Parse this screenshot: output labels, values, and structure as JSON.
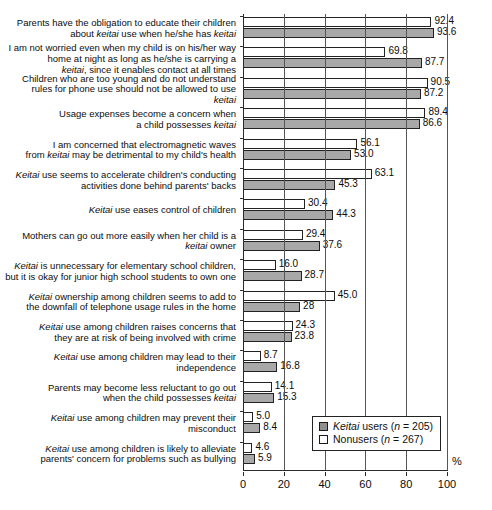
{
  "chart_data": {
    "type": "bar",
    "orientation": "horizontal",
    "title": "",
    "xlabel": "%",
    "ylabel": "",
    "xlim": [
      0,
      100
    ],
    "xticks": [
      "0",
      "20",
      "40",
      "60",
      "80",
      "100"
    ],
    "grid": true,
    "legend_position": "bottom-right",
    "categories": [
      "Parents have the obligation to educate their children about keitai use when he/she has keitai",
      "I am not worried even when my child is on his/her way home at night as long as he/she is carrying a keitai, since it enables contact at all times",
      "Children who are too young and do not understand rules for phone use should not be allowed to use keitai",
      "Usage expenses become a concern when a child possesses keitai",
      "I am concerned that electromagnetic waves from keitai may be detrimental to my child's health",
      "Keitai use seems to accelerate children's conducting activities done behind  parents' backs",
      "Keitai use eases control of children",
      "Mothers can go out more easily when her child is a keitai owner",
      "Keitai is unnecessary for elementary school children, but it is okay for junior high school students to own one",
      "Keitai ownership among children seems to add to the downfall of telephone usage rules in the home",
      "Keitai use among children raises concerns that they are at risk of being involved with crime",
      "Keitai use among children may lead to their independence",
      "Parents may become less reluctant to go out when the child possesses keitai",
      "Keitai use among children may prevent their misconduct",
      "Keitai use among children is likely to alleviate parents' concern for problems such as bullying"
    ],
    "series": [
      {
        "name": "Nonusers (n = 267)",
        "key": "nonusers",
        "color": "#ffffff",
        "values": [
          92.4,
          69.8,
          90.5,
          89.4,
          56.1,
          63.1,
          30.4,
          29.4,
          16.0,
          45.0,
          24.3,
          8.7,
          14.1,
          5.0,
          4.6
        ],
        "labels": [
          "92.4",
          "69.8",
          "90.5",
          "89.4",
          "56.1",
          "63.1",
          "30.4",
          "29.4",
          "16.0",
          "45.0",
          "24.3",
          "8.7",
          "14.1",
          "5.0",
          "4.6"
        ]
      },
      {
        "name": "Keitai users (n = 205)",
        "key": "users",
        "color": "#a8a8a8",
        "values": [
          93.6,
          87.7,
          87.2,
          86.6,
          53.0,
          45.3,
          44.3,
          37.6,
          28.7,
          28.0,
          23.8,
          16.8,
          15.3,
          8.4,
          5.9
        ],
        "labels": [
          "93.6",
          "87.7",
          "87.2",
          "86.6",
          "53.0",
          "45.3",
          "44.3",
          "37.6",
          "28.7",
          "28",
          "23.8",
          "16.8",
          "15.3",
          "8.4",
          "5.9"
        ]
      }
    ]
  },
  "legend": {
    "items": [
      {
        "label_html": "<em>Keitai</em> users (<em>n</em> = 205)",
        "swatch": "users"
      },
      {
        "label_html": "Nonusers (<em>n</em> = 267)",
        "swatch": "nonusers"
      }
    ]
  },
  "category_labels_html": [
    "Parents have the obligation to educate their children<br>about <em>keitai</em> use when he/she has <em>keitai</em>",
    "I am not worried even when my child is on his/her way<br>home at night as long as he/she is carrying a<br><em>keitai</em>, since it enables contact at all times",
    "Children who are too young and do not understand<br>rules for phone use should not be allowed to use<br><em>keitai</em>",
    "Usage expenses become a concern when<br>a child possesses <em>keitai</em>",
    "I am concerned that electromagnetic waves<br>from <em>keitai</em> may be detrimental to my child's health",
    "<em>Keitai</em> use seems to accelerate children's conducting<br>activities done behind  parents' backs",
    "<em>Keitai</em> use eases control of children",
    "Mothers can go out more easily when her child is a<br><em>keitai</em> owner",
    "<em>Keitai</em> is unnecessary for elementary school children,<br>but it is okay for junior high school students to own one",
    "<em>Keitai</em> ownership among children seems to add to<br>the downfall of telephone usage rules in the home",
    "<em>Keitai</em> use among children raises concerns that<br>they are at risk of being involved with crime",
    "<em>Keitai</em> use among children may lead to their<br>independence",
    "Parents may become less reluctant to go out<br>when the child possesses <em>keitai</em>",
    "<em>Keitai</em> use among children may prevent their<br>misconduct",
    "<em>Keitai</em> use among children is likely to alleviate<br>parents' concern for problems such as bullying"
  ]
}
